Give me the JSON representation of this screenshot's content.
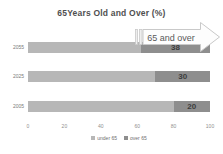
{
  "chart_data": {
    "type": "bar",
    "orientation": "horizontal",
    "stacked": true,
    "title": "65Years Old and Over (%)",
    "categories": [
      "2055",
      "2025",
      "2005"
    ],
    "series": [
      {
        "name": "under 65",
        "color": "#b7b7b7",
        "values": [
          62,
          70,
          80
        ]
      },
      {
        "name": "over 65",
        "color": "#8e8e8e",
        "values": [
          38,
          30,
          20
        ]
      }
    ],
    "value_labels": [
      "38",
      "30",
      "20"
    ],
    "x_ticks": [
      "0",
      "20",
      "40",
      "60",
      "80",
      "100"
    ],
    "xlim": [
      0,
      100
    ],
    "grid": false,
    "legend_position": "bottom",
    "annotation": {
      "label": "65 and over",
      "shape": "striped-right-arrow"
    }
  }
}
